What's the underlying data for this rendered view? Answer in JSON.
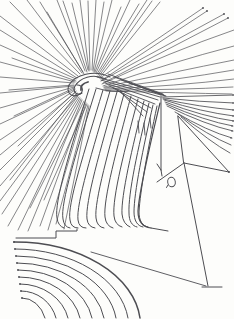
{
  "artwork": {
    "kind": "abstract-ink-line-drawing",
    "ink_color": "#4d4d52",
    "paper_color": "#fdfdfb",
    "parts": {
      "burst": "radial-line-burst",
      "knot": "spiral-hook-knot",
      "curtain": "sweeping-curve-curtain",
      "pylon": "triangular-pylon-with-kite-brace",
      "oval": "small-oval-window",
      "arcs": "nested-ground-arcs",
      "step": "stepped-baseline"
    }
  }
}
